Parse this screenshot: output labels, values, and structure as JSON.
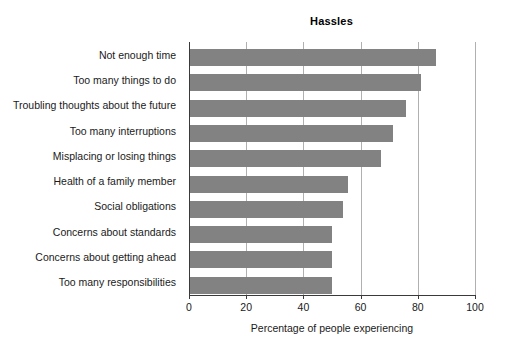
{
  "chart_data": {
    "type": "bar",
    "orientation": "horizontal",
    "title": "Hassles",
    "xlabel": "Percentage of people experiencing",
    "ylabel": "",
    "xlim": [
      0,
      100
    ],
    "xticks": [
      0,
      20,
      40,
      60,
      80,
      100
    ],
    "xtick_labels": [
      "0",
      "20",
      "40",
      "60",
      "80",
      "100"
    ],
    "grid": "vertical",
    "legend": null,
    "bar_color": "#828282",
    "axis_color": "#3a3a3a",
    "gridline_color": "#b0b0b0",
    "categories": [
      "Not enough time",
      "Too many things to do",
      "Troubling thoughts about the future",
      "Too many interruptions",
      "Misplacing or losing things",
      "Health of a family member",
      "Social obligations",
      "Concerns about standards",
      "Concerns about getting ahead",
      "Too many responsibilities"
    ],
    "values": [
      86.5,
      81,
      76,
      71.5,
      67,
      55.5,
      54,
      50,
      50,
      50
    ]
  }
}
